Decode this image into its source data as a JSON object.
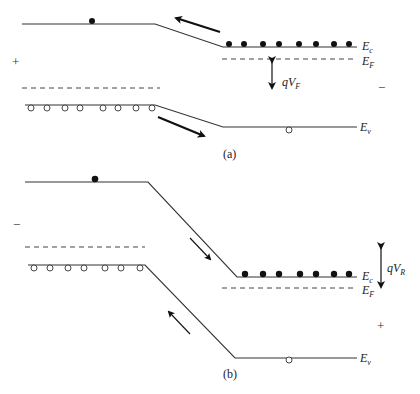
{
  "diagram": {
    "type": "pn-junction energy band diagram",
    "panels": [
      {
        "id": "a",
        "caption": "(a)",
        "bias": "forward",
        "left_sign": "+",
        "right_sign": "−",
        "labels": {
          "Ec": {
            "main": "E",
            "sub": "c"
          },
          "EF": {
            "main": "E",
            "sub": "F"
          },
          "Ev": {
            "main": "E",
            "sub": "v"
          },
          "voltage": {
            "main": "qV",
            "sub": "F"
          }
        },
        "electrons_right": 8,
        "holes_left": 8,
        "electrons_left": 1,
        "holes_right": 1
      },
      {
        "id": "b",
        "caption": "(b)",
        "bias": "reverse",
        "left_sign": "−",
        "right_sign": "+",
        "labels": {
          "Ec": {
            "main": "E",
            "sub": "c"
          },
          "EF": {
            "main": "E",
            "sub": "F"
          },
          "Ev": {
            "main": "E",
            "sub": "v"
          },
          "voltage": {
            "main": "qV",
            "sub": "R"
          }
        },
        "electrons_right": 7,
        "holes_left": 7,
        "electrons_left": 1,
        "holes_right": 1
      }
    ]
  },
  "colors": {
    "line": "#333333",
    "ink": "#111111",
    "background": "#ffffff"
  }
}
